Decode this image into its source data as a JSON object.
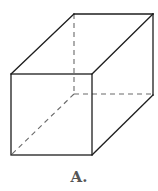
{
  "figure": {
    "type": "rectangular-prism",
    "caption": "A.",
    "colors": {
      "edge": "#1e1e1e",
      "hidden_edge": "#6a6a6a",
      "caption": "#555555",
      "background": "#ffffff"
    },
    "vertices": {
      "front_top_left": [
        11,
        74
      ],
      "front_top_right": [
        92,
        74
      ],
      "front_bottom_left": [
        11,
        155
      ],
      "front_bottom_right": [
        92,
        155
      ],
      "back_top_left": [
        74,
        14
      ],
      "back_top_right": [
        153,
        14
      ],
      "back_bottom_left": [
        74,
        94
      ],
      "back_bottom_right": [
        153,
        95
      ]
    },
    "visible_edges": 9,
    "hidden_edges": 3
  }
}
